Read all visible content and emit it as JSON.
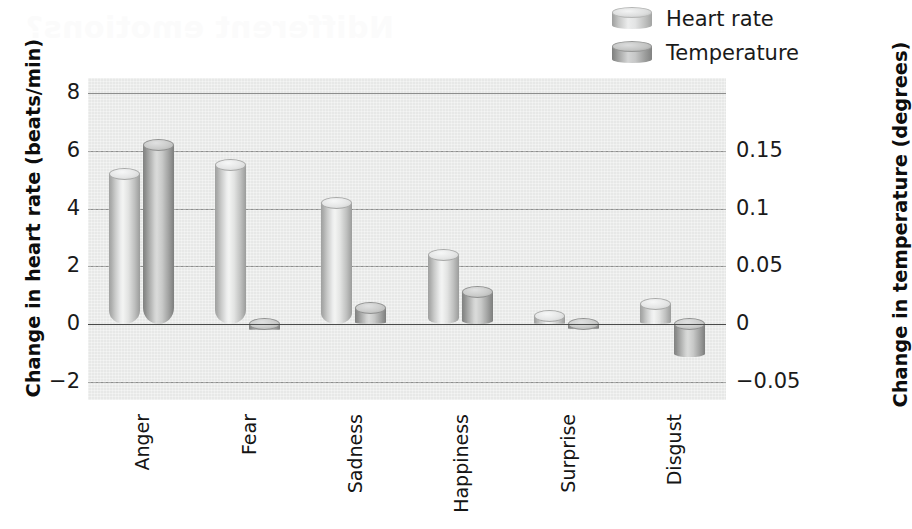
{
  "legend": {
    "items": [
      {
        "label": "Heart rate",
        "swatch": "cylinder-light-icon",
        "color": "#e0e1e0"
      },
      {
        "label": "Temperature",
        "swatch": "cylinder-dark-icon",
        "color": "#c0c1c0"
      }
    ]
  },
  "axes": {
    "left": {
      "title": "Change in heart rate (beats/min)",
      "ticks": [
        "8",
        "6",
        "4",
        "2",
        "0",
        "−2"
      ],
      "values": [
        8,
        6,
        4,
        2,
        0,
        -2
      ],
      "range": [
        -2.62,
        8.52
      ]
    },
    "right": {
      "title": "Change in temperature (degrees)",
      "ticks": [
        "0.15",
        "0.1",
        "0.05",
        "0",
        "−0.05"
      ],
      "values": [
        0.15,
        0.1,
        0.05,
        0,
        -0.05
      ],
      "range": [
        -0.0655,
        0.213
      ]
    }
  },
  "bleed_text": "Ndifferent emotions?",
  "chart_data": {
    "type": "bar",
    "title": "",
    "subtitle": "",
    "xlabel": "",
    "ylabel": "Change in heart rate (beats/min)",
    "y2label": "Change in temperature (degrees)",
    "categories": [
      "Anger",
      "Fear",
      "Sadness",
      "Happiness",
      "Surprise",
      "Disgust"
    ],
    "series": [
      {
        "name": "Heart rate",
        "axis": "left",
        "unit": "beats/min",
        "values": [
          5.2,
          5.5,
          4.2,
          2.4,
          0.3,
          0.7
        ]
      },
      {
        "name": "Temperature",
        "axis": "right",
        "unit": "degrees",
        "values": [
          0.155,
          -0.005,
          0.014,
          0.028,
          -0.004,
          -0.028
        ]
      }
    ],
    "ylim": [
      -2.62,
      8.52
    ],
    "y2lim": [
      -0.0655,
      0.213
    ],
    "grid": true,
    "grid_solid_axis": "left",
    "grid_dashed_axis": "right",
    "legend_position": "top-right",
    "bar_style": "3d-cylinder"
  }
}
